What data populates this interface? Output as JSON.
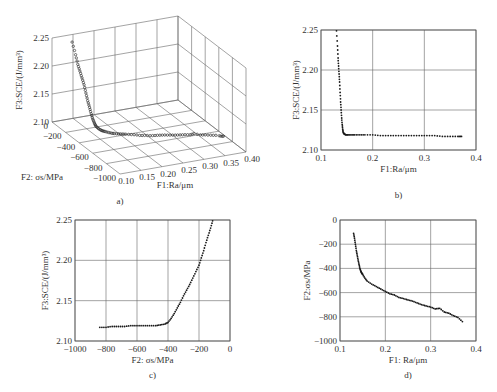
{
  "figure": {
    "panel_labels": [
      "a)",
      "b)",
      "c)",
      "d)"
    ]
  },
  "colors": {
    "axis": "#555555",
    "grid": "#666666",
    "marker": "#1a1a1a",
    "text": "#333333"
  },
  "chart_data": [
    {
      "id": "a",
      "type": "scatter3d",
      "panel_label": "a)",
      "xlabel": "F1:Ra/μm",
      "ylabel": "F2: σs/MPa",
      "zlabel": "F3:SCE/(J/mm³)",
      "x_ticks": [
        "0.10",
        "0.15",
        "0.20",
        "0.25",
        "0.30",
        "0.35",
        "0.40"
      ],
      "y_ticks": [
        "0",
        "-200",
        "-400",
        "-600",
        "-800",
        "-1000"
      ],
      "z_ticks": [
        "2.25",
        "2.20",
        "2.15",
        "2.10"
      ],
      "xlim": [
        0.1,
        0.4
      ],
      "ylim": [
        -1000,
        0
      ],
      "zlim": [
        2.1,
        2.25
      ],
      "grid": true,
      "description": "3D Pareto front: SCE drops steeply as Ra rises from ~0.13 to ~0.15 and stress goes from ~-120 to ~-450 MPa, then stays flat near 2.118 up to Ra≈0.37, σs≈-850 MPa"
    },
    {
      "id": "b",
      "type": "scatter",
      "panel_label": "b)",
      "xlabel": "F1:Ra/μm",
      "ylabel": "F3:SCE/(J/mm³)",
      "x_ticks": [
        "0.1",
        "0.2",
        "0.3",
        "0.4"
      ],
      "y_ticks": [
        "2.10",
        "2.15",
        "2.20",
        "2.25"
      ],
      "xlim": [
        0.1,
        0.4
      ],
      "ylim": [
        2.1,
        2.25
      ],
      "grid": true,
      "series": [
        {
          "name": "Pareto front (Ra vs SCE)",
          "x": [
            0.13,
            0.132,
            0.133,
            0.134,
            0.135,
            0.136,
            0.137,
            0.138,
            0.139,
            0.14,
            0.141,
            0.142,
            0.143,
            0.145,
            0.148,
            0.152,
            0.158,
            0.165,
            0.175,
            0.185,
            0.2,
            0.215,
            0.23,
            0.245,
            0.26,
            0.275,
            0.29,
            0.305,
            0.32,
            0.335,
            0.35,
            0.365,
            0.372
          ],
          "y": [
            2.249,
            2.23,
            2.215,
            2.205,
            2.195,
            2.185,
            2.172,
            2.16,
            2.15,
            2.14,
            2.132,
            2.126,
            2.122,
            2.12,
            2.119,
            2.119,
            2.119,
            2.119,
            2.119,
            2.119,
            2.119,
            2.118,
            2.118,
            2.118,
            2.118,
            2.118,
            2.118,
            2.118,
            2.118,
            2.117,
            2.117,
            2.117,
            2.117
          ]
        }
      ]
    },
    {
      "id": "c",
      "type": "scatter",
      "panel_label": "c)",
      "xlabel": "F2: σs/MPa",
      "ylabel": "F3:SCE/(J/mm³)",
      "x_ticks": [
        "-1000",
        "-800",
        "-600",
        "-400",
        "-200",
        "0"
      ],
      "y_ticks": [
        "2.10",
        "2.15",
        "2.20",
        "2.25"
      ],
      "xlim": [
        -1000,
        0
      ],
      "ylim": [
        2.1,
        2.25
      ],
      "grid": true,
      "series": [
        {
          "name": "Pareto front (σs vs SCE)",
          "x": [
            -840,
            -800,
            -760,
            -720,
            -680,
            -640,
            -600,
            -560,
            -520,
            -480,
            -450,
            -420,
            -400,
            -380,
            -360,
            -340,
            -320,
            -300,
            -280,
            -260,
            -240,
            -220,
            -200,
            -185,
            -170,
            -155,
            -140,
            -125,
            -112
          ],
          "y": [
            2.117,
            2.117,
            2.118,
            2.118,
            2.118,
            2.119,
            2.119,
            2.119,
            2.119,
            2.119,
            2.12,
            2.121,
            2.123,
            2.128,
            2.134,
            2.141,
            2.148,
            2.156,
            2.163,
            2.17,
            2.178,
            2.186,
            2.194,
            2.203,
            2.212,
            2.222,
            2.231,
            2.24,
            2.249
          ]
        }
      ]
    },
    {
      "id": "d",
      "type": "scatter",
      "panel_label": "d)",
      "xlabel": "F1: Ra/μm",
      "ylabel": "F2:σs/MPa",
      "x_ticks": [
        "0.1",
        "0.2",
        "0.3",
        "0.4"
      ],
      "y_ticks": [
        "0",
        "-200",
        "-400",
        "-600",
        "-800",
        "-1000"
      ],
      "xlim": [
        0.1,
        0.4
      ],
      "ylim": [
        -1000,
        0
      ],
      "grid": true,
      "series": [
        {
          "name": "Pareto front (Ra vs σs)",
          "x": [
            0.13,
            0.132,
            0.134,
            0.136,
            0.138,
            0.14,
            0.142,
            0.144,
            0.146,
            0.148,
            0.15,
            0.155,
            0.16,
            0.17,
            0.18,
            0.19,
            0.2,
            0.21,
            0.22,
            0.23,
            0.24,
            0.25,
            0.26,
            0.27,
            0.28,
            0.29,
            0.3,
            0.31,
            0.32,
            0.33,
            0.34,
            0.35,
            0.36,
            0.37
          ],
          "y": [
            -110,
            -150,
            -200,
            -250,
            -290,
            -330,
            -365,
            -400,
            -425,
            -440,
            -450,
            -480,
            -505,
            -530,
            -550,
            -570,
            -590,
            -610,
            -620,
            -640,
            -650,
            -660,
            -670,
            -685,
            -700,
            -710,
            -720,
            -735,
            -730,
            -760,
            -770,
            -790,
            -805,
            -840
          ]
        }
      ]
    }
  ]
}
